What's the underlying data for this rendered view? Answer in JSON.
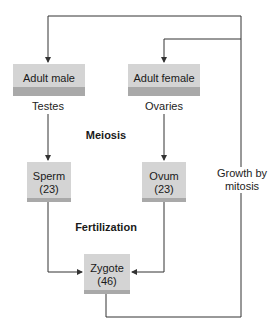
{
  "diagram": {
    "nodes": {
      "adult_male": "Adult male",
      "adult_female": "Adult female",
      "sperm_line1": "Sperm",
      "sperm_line2": "(23)",
      "ovum_line1": "Ovum",
      "ovum_line2": "(23)",
      "zygote_line1": "Zygote",
      "zygote_line2": "(46)"
    },
    "labels": {
      "testes": "Testes",
      "ovaries": "Ovaries",
      "meiosis": "Meiosis",
      "fertilization": "Fertilization",
      "growth_line1": "Growth by",
      "growth_line2": "mitosis"
    },
    "colors": {
      "box_fill": "#d4d4d4",
      "box_shade": "#a9a9a9",
      "line": "#333333"
    }
  }
}
